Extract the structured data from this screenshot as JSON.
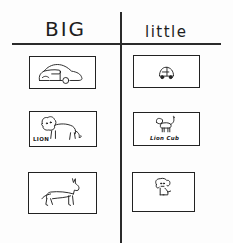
{
  "headers": {
    "left": "BIG",
    "right": "little"
  },
  "rows": [
    {
      "big": {
        "subject": "car",
        "icon": "car-icon",
        "caption": ""
      },
      "little": {
        "subject": "toy car",
        "icon": "small-car-icon",
        "caption": ""
      }
    },
    {
      "big": {
        "subject": "lion",
        "icon": "lion-icon",
        "caption": "LION"
      },
      "little": {
        "subject": "lion cub",
        "icon": "lion-cub-icon",
        "caption": "Lion Cub"
      }
    },
    {
      "big": {
        "subject": "dog",
        "icon": "dog-icon",
        "caption": ""
      },
      "little": {
        "subject": "puppy",
        "icon": "puppy-icon",
        "caption": ""
      }
    }
  ],
  "colors": {
    "ink": "#222222",
    "paper": "#ffffff"
  }
}
